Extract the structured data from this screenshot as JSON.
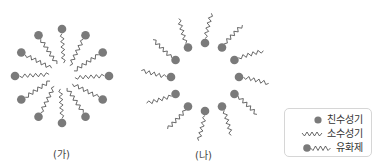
{
  "colors": {
    "head": "#7a7a7a",
    "tail": "#444444",
    "text": "#333333",
    "legend_border": "#d6d6d6"
  },
  "diagrams": [
    {
      "id": "ga",
      "caption": "(가)",
      "orientation": "heads-outward",
      "center": [
        62,
        76
      ],
      "head_radius_px": 47,
      "tail_inner_px": 13,
      "molecule_count": 12
    },
    {
      "id": "na",
      "caption": "(나)",
      "orientation": "heads-inward",
      "center": [
        205,
        77
      ],
      "head_radius_px": 34,
      "tail_outer_px": 64,
      "molecule_count": 12
    }
  ],
  "legend": {
    "items": [
      {
        "icon": "hydrophilic-head-icon",
        "label": "친수성기"
      },
      {
        "icon": "hydrophobic-tail-icon",
        "label": "소수성기"
      },
      {
        "icon": "surfactant-molecule-icon",
        "label": "유화제"
      }
    ]
  }
}
